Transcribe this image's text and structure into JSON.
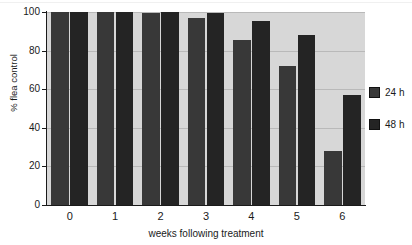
{
  "chart_data": {
    "type": "bar",
    "title": "",
    "subtitle": "",
    "xlabel": "weeks following treatment",
    "ylabel": "% flea control",
    "categories": [
      "0",
      "1",
      "2",
      "3",
      "4",
      "5",
      "6"
    ],
    "series": [
      {
        "name": "24 h",
        "color": "#383838",
        "values": [
          100,
          100,
          99.5,
          97,
          85.5,
          72,
          28
        ]
      },
      {
        "name": "48 h",
        "color": "#242424",
        "values": [
          100,
          100,
          100,
          99.5,
          95.5,
          88,
          57
        ]
      }
    ],
    "ylim": [
      0,
      100
    ],
    "yticks": [
      0,
      20,
      40,
      60,
      80,
      100
    ],
    "ytick_labels": [
      "0",
      "20",
      "40",
      "60",
      "80",
      "100"
    ],
    "grid": true,
    "grid_axis": "y",
    "legend_position": "right",
    "plot_background": "#d7d7d7",
    "axis_color": "#1a1a1a",
    "gridline_color": "#b9b9b9"
  },
  "legend": {
    "entries": [
      {
        "label": "24 h",
        "swatch": "#383838"
      },
      {
        "label": "48 h",
        "swatch": "#242424"
      }
    ]
  }
}
